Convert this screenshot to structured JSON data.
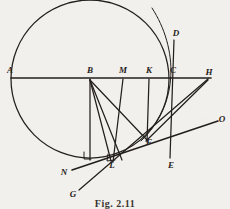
{
  "figure": {
    "caption": "Fig. 2.11",
    "background_color": "#f2f0ec",
    "ink_color": "#231f1d",
    "width": 230,
    "height": 209
  },
  "labels": {
    "A": "A",
    "B": "B",
    "M": "M",
    "K": "K",
    "C": "C",
    "H": "H",
    "D": "D",
    "E": "E",
    "F": "F",
    "L": "L",
    "N": "N",
    "G": "G",
    "O": "O"
  },
  "geometry": {
    "circle": {
      "cx": 90,
      "cy": 79,
      "r": 79
    },
    "points": {
      "A": {
        "x": 12,
        "y": 78
      },
      "B": {
        "x": 90,
        "y": 79
      },
      "M": {
        "x": 123,
        "y": 79
      },
      "K": {
        "x": 149,
        "y": 79
      },
      "C": {
        "x": 172,
        "y": 79
      },
      "H": {
        "x": 207,
        "y": 79
      },
      "D": {
        "x": 175,
        "y": 34
      },
      "E": {
        "x": 170,
        "y": 162
      },
      "F": {
        "x": 147,
        "y": 139
      },
      "L": {
        "x": 112,
        "y": 161
      },
      "N": {
        "x": 66,
        "y": 172
      },
      "G": {
        "x": 73,
        "y": 194
      },
      "O": {
        "x": 221,
        "y": 120
      }
    },
    "segments": [
      {
        "name": "diameter-A-H",
        "from": "A",
        "to": "H"
      },
      {
        "name": "vertical-D-E",
        "from": "D",
        "to": "E"
      },
      {
        "name": "dropper-B-foot",
        "from": "B",
        "to": "B-foot"
      },
      {
        "name": "dropper-M-L",
        "from": "M",
        "to": "L"
      },
      {
        "name": "dropper-K-F",
        "from": "K",
        "to": "F"
      },
      {
        "name": "chord-B-L",
        "from": "B",
        "to": "L"
      },
      {
        "name": "chord-B-F",
        "from": "B",
        "to": "F"
      },
      {
        "name": "chord-B-Lfoot",
        "from": "B",
        "to": "L-foot"
      },
      {
        "name": "ray-F-H",
        "from": "F",
        "to": "H"
      },
      {
        "name": "tangent-N-O",
        "from": "N",
        "to": "O"
      },
      {
        "name": "ray-G-H",
        "from": "G",
        "to": "H"
      }
    ],
    "right_angle_marks": [
      {
        "name": "right-angle-at-B-foot",
        "x": 90,
        "y": 156
      },
      {
        "name": "right-angle-at-L",
        "x": 112,
        "y": 158
      }
    ]
  }
}
